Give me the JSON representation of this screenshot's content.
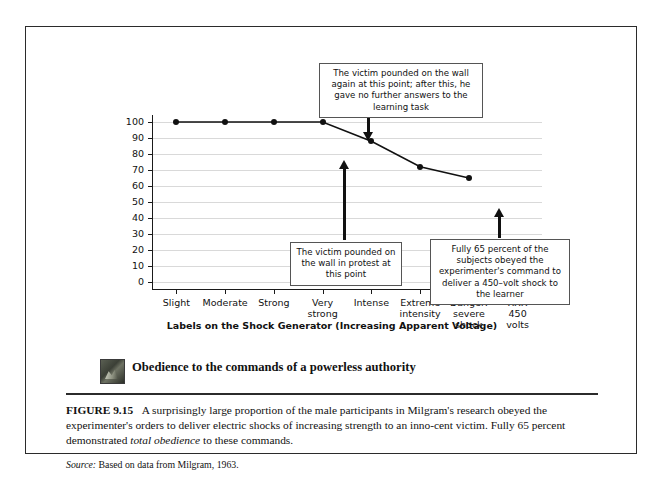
{
  "figure": {
    "number": "FIGURE 9.15",
    "caption_part1": "A surprisingly large proportion of the male participants in Milgram's research obeyed the experimenter's orders to deliver electric shocks of increasing strength to an inno-cent victim. Fully 65 percent demonstrated ",
    "caption_emphasis": "total obedience",
    "caption_part2": " to these commands.",
    "source_label": "Source:",
    "source_text": "Based on data from Milgram, 1963.",
    "section_heading": "Obedience to the commands of a powerless authority",
    "thumbnail_name": "milgram-photo-thumbnail"
  },
  "callouts": [
    {
      "id": "callout-top",
      "text": "The victim pounded on the wall again at this point; after this, he gave no further answers to the learning task"
    },
    {
      "id": "callout-mid",
      "text": "The victim pounded on the wall in protest at this point"
    },
    {
      "id": "callout-right",
      "text": "Fully 65 percent of the subjects obeyed the experimenter's command to deliver a 450–volt shock to the learner"
    }
  ],
  "chart_data": {
    "type": "line",
    "title": "",
    "xlabel": "Labels on the Shock Generator (Increasing Apparent Voltage)",
    "ylabel": "Percentage of Subjects Who Obey the Experimenter's Commands at Each Supposed Shock Level",
    "categories": [
      "Slight",
      "Moderate",
      "Strong",
      "Very strong",
      "Intense",
      "Extreme intensity",
      "Danger: severe shock",
      "XXX 450 volts"
    ],
    "values": [
      100,
      100,
      100,
      100,
      88,
      72,
      65,
      null
    ],
    "ylim": [
      0,
      100
    ],
    "yticks": [
      0,
      10,
      20,
      30,
      40,
      50,
      60,
      70,
      80,
      90,
      100
    ],
    "ytick_labels": [
      "0",
      "10",
      "20",
      "30",
      "40",
      "50",
      "60",
      "70",
      "80",
      "90",
      "100"
    ],
    "grid": true,
    "legend": "none",
    "marker": "filled-circle",
    "line_color": "#111111"
  }
}
